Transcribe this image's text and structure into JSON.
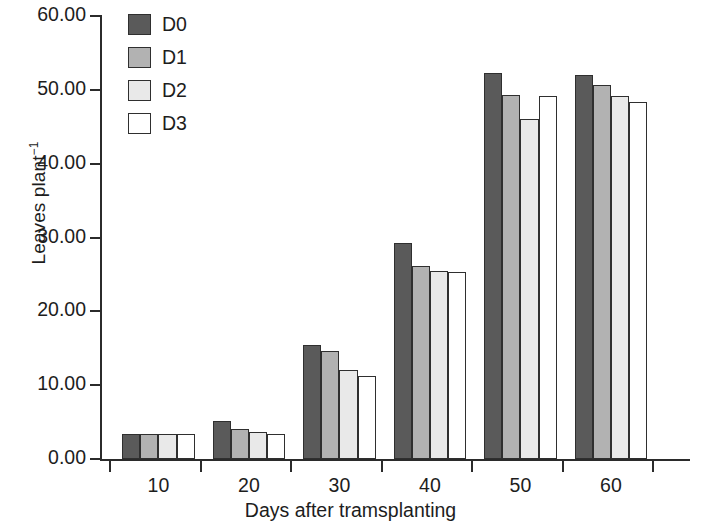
{
  "chart_data": {
    "type": "bar",
    "title": "",
    "xlabel": "Days after tramsplanting",
    "ylabel": "Leaves plant",
    "ylabel_sup": "−1",
    "categories": [
      "10",
      "20",
      "30",
      "40",
      "50",
      "60"
    ],
    "ylim": [
      0,
      60
    ],
    "yticks": [
      0,
      10,
      20,
      30,
      40,
      50,
      60
    ],
    "ytick_labels": [
      "0.00",
      "10.00",
      "20.00",
      "30.00",
      "40.00",
      "50.00",
      "60.00"
    ],
    "grid": false,
    "legend_position": "top-left-inside",
    "series": [
      {
        "name": "D0",
        "color": "#5a5a5a",
        "values": [
          3.4,
          5.2,
          15.5,
          29.2,
          52.3,
          52.0
        ]
      },
      {
        "name": "D1",
        "color": "#b2b2b2",
        "values": [
          3.4,
          4.1,
          14.6,
          26.2,
          49.3,
          50.7
        ]
      },
      {
        "name": "D2",
        "color": "#e9e9e9",
        "values": [
          3.4,
          3.7,
          12.1,
          25.5,
          46.0,
          49.2
        ]
      },
      {
        "name": "D3",
        "color": "#ffffff",
        "values": [
          3.4,
          3.4,
          11.3,
          25.3,
          49.2,
          48.3
        ]
      }
    ]
  },
  "axis_colors": {
    "axis_line": "#2b2b2b",
    "bar_outline": "#2f2f2f",
    "text": "#1d1d1d",
    "background": "#ffffff"
  }
}
